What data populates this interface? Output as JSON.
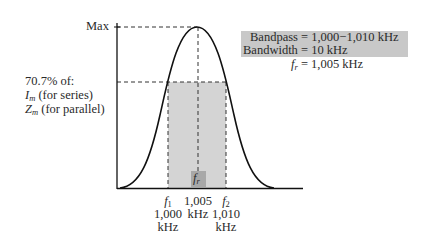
{
  "diagram": {
    "type": "resonance-curve",
    "y_axis": {
      "max_label": "Max",
      "threshold_label_lines": [
        "70.7% of:",
        "(for series)",
        "(for parallel)"
      ],
      "threshold_symbols": [
        {
          "base": "I",
          "sub": "m",
          "text": " (for series)"
        },
        {
          "base": "Z",
          "sub": "m",
          "text": " (for parallel)"
        }
      ],
      "threshold_heading": "70.7% of:"
    },
    "x_axis": {
      "f1": {
        "symbol": "f",
        "sub": "1",
        "value": "1,000",
        "unit": "kHz"
      },
      "fr_tick": {
        "value": "1,005",
        "unit": "kHz"
      },
      "f2": {
        "symbol": "f",
        "sub": "2",
        "value": "1,010",
        "unit": "kHz"
      },
      "fr_box": {
        "symbol": "f",
        "sub": "r"
      }
    },
    "info": {
      "bandpass": "Bandpass = 1,000−1,010 kHz",
      "bandwidth": "Bandwidth = 10 kHz",
      "fr_symbol": "f",
      "fr_sub": "r",
      "fr_value": " = 1,005 kHz"
    },
    "colors": {
      "curve": "#111111",
      "shade": "#d4d4d4",
      "info_bg": "#c8c8c8",
      "fr_box": "#a8a8a8",
      "dash": "#333333"
    }
  }
}
